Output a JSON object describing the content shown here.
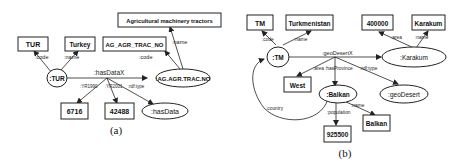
{
  "diagram_a": {
    "caption": "(a)",
    "nodes": {
      "tur_code": "TUR",
      "turkey": "Turkey",
      "ag_code": "AG_AGR_TRAC_NO",
      "ag_name": "Agricultural machinery tractors",
      "tur_res": ":TUR",
      "ag_res": ":AG.AGR.TRAC.NO",
      "val1990": "6716",
      "val2001": "42488",
      "hasdata": ":hasData"
    },
    "edges": {
      "code1": ":code",
      "name1": ":name",
      "code2": ":code",
      "name2": ":name",
      "hasdatax": ":hasDataX",
      "yr1990": ":YR1990",
      "yr2001": ":YR2001",
      "type": ":rdf:type"
    }
  },
  "diagram_b": {
    "caption": "(b)",
    "nodes": {
      "tm_code": "TM",
      "turkmenistan": "Turkmenistan",
      "area_val": "400000",
      "karakum_name": "Karakum",
      "tm_res": ":TM",
      "karakum_res": ":Karakum",
      "west": "West",
      "balkan_res": ":Balkan",
      "geodesert": ":geoDesert",
      "population_val": "925500",
      "balkan_name": "Balkan"
    },
    "edges": {
      "code": ":code",
      "name1": ":name",
      "area": ":area",
      "name2": ":name",
      "geodesertx": ":geoDesertX",
      "area2": ":area",
      "hasprovince": ":hasProvince",
      "type": ":rdf:type",
      "country": ":country",
      "population": ":population",
      "name3": ":name"
    }
  }
}
